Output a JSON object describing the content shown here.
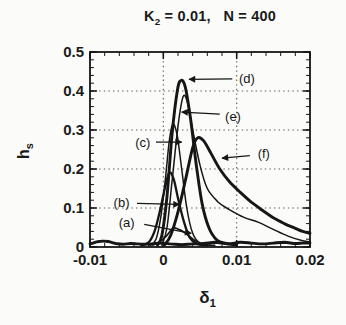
{
  "colors": {
    "ink": "#161616",
    "grid": "#5a5a5a",
    "background": "#fbfbf9"
  },
  "chart_data": {
    "type": "line",
    "title": "K2 = 0.01,  N = 400",
    "title_parts": {
      "base": "K",
      "sub": "2",
      "rest": " = 0.01,   N = 400"
    },
    "xlabel": "delta_1",
    "ylabel": "h_s",
    "xlabel_parts": {
      "base": "δ",
      "sub": "1"
    },
    "ylabel_parts": {
      "base": "h",
      "sub": "s"
    },
    "xlim": [
      -0.01,
      0.02
    ],
    "ylim": [
      0,
      0.5
    ],
    "grid": "dotted",
    "legend": "none",
    "x_ticks": [
      {
        "v": -0.01,
        "label": "-0.01"
      },
      {
        "v": 0,
        "label": "0"
      },
      {
        "v": 0.01,
        "label": "0.01"
      },
      {
        "v": 0.02,
        "label": "0.02"
      }
    ],
    "y_ticks": [
      {
        "v": 0,
        "label": "0"
      },
      {
        "v": 0.1,
        "label": "0.1"
      },
      {
        "v": 0.2,
        "label": "0.2"
      },
      {
        "v": 0.3,
        "label": "0.3"
      },
      {
        "v": 0.4,
        "label": "0.4"
      },
      {
        "v": 0.5,
        "label": "0.5"
      }
    ],
    "x_grid": [
      0,
      0.01
    ],
    "y_grid": [
      0.1,
      0.2,
      0.3,
      0.4
    ],
    "x_minor_step": 0.002,
    "y_minor_step": 0.02,
    "series": [
      {
        "name": "(a)",
        "width": 1.7,
        "points": [
          [
            -0.0015,
            0.005
          ],
          [
            -0.0005,
            0.013
          ],
          [
            0.0004,
            0.028
          ],
          [
            0.0013,
            0.048
          ],
          [
            0.002,
            0.046
          ],
          [
            0.003,
            0.036
          ],
          [
            0.0042,
            0.018
          ],
          [
            0.0055,
            0.007
          ],
          [
            0.007,
            0.004
          ]
        ]
      },
      {
        "name": "(b)",
        "width": 2.3,
        "points": [
          [
            -0.003,
            0.004
          ],
          [
            -0.002,
            0.012
          ],
          [
            -0.0012,
            0.04
          ],
          [
            -0.0005,
            0.09
          ],
          [
            0.0002,
            0.15
          ],
          [
            0.0008,
            0.19
          ],
          [
            0.0014,
            0.175
          ],
          [
            0.002,
            0.125
          ],
          [
            0.0028,
            0.065
          ],
          [
            0.0036,
            0.024
          ],
          [
            0.0046,
            0.008
          ],
          [
            0.006,
            0.004
          ]
        ]
      },
      {
        "name": "(c)",
        "width": 1.5,
        "points": [
          [
            -0.0018,
            0.004
          ],
          [
            -0.001,
            0.02
          ],
          [
            -0.0004,
            0.07
          ],
          [
            0.0002,
            0.16
          ],
          [
            0.0008,
            0.27
          ],
          [
            0.0013,
            0.315
          ],
          [
            0.0019,
            0.285
          ],
          [
            0.0025,
            0.2
          ],
          [
            0.0032,
            0.1
          ],
          [
            0.004,
            0.035
          ],
          [
            0.005,
            0.01
          ],
          [
            0.0065,
            0.004
          ]
        ]
      },
      {
        "name": "(d)",
        "width": 2.9,
        "points": [
          [
            -0.0008,
            0.005
          ],
          [
            -0.0002,
            0.03
          ],
          [
            0.0005,
            0.13
          ],
          [
            0.0012,
            0.29
          ],
          [
            0.0019,
            0.4
          ],
          [
            0.0024,
            0.427
          ],
          [
            0.003,
            0.41
          ],
          [
            0.0037,
            0.33
          ],
          [
            0.0045,
            0.21
          ],
          [
            0.0053,
            0.11
          ],
          [
            0.0062,
            0.05
          ],
          [
            0.0073,
            0.018
          ],
          [
            0.0086,
            0.009
          ],
          [
            0.01,
            0.005
          ]
        ]
      },
      {
        "name": "(e)",
        "width": 1.5,
        "points": [
          [
            -0.0002,
            0.004
          ],
          [
            0.0005,
            0.05
          ],
          [
            0.0012,
            0.17
          ],
          [
            0.002,
            0.31
          ],
          [
            0.0027,
            0.385
          ],
          [
            0.0033,
            0.37
          ],
          [
            0.004,
            0.3
          ],
          [
            0.005,
            0.21
          ],
          [
            0.006,
            0.15
          ],
          [
            0.0075,
            0.115
          ],
          [
            0.009,
            0.096
          ],
          [
            0.011,
            0.076
          ],
          [
            0.013,
            0.063
          ],
          [
            0.015,
            0.045
          ],
          [
            0.017,
            0.028
          ],
          [
            0.019,
            0.016
          ],
          [
            0.02,
            0.013
          ]
        ]
      },
      {
        "name": "(f)",
        "width": 2.9,
        "points": [
          [
            0.0002,
            0.006
          ],
          [
            0.001,
            0.03
          ],
          [
            0.002,
            0.09
          ],
          [
            0.003,
            0.17
          ],
          [
            0.004,
            0.255
          ],
          [
            0.0047,
            0.28
          ],
          [
            0.0055,
            0.272
          ],
          [
            0.0065,
            0.24
          ],
          [
            0.0077,
            0.2
          ],
          [
            0.009,
            0.168
          ],
          [
            0.0105,
            0.14
          ],
          [
            0.012,
            0.115
          ],
          [
            0.0135,
            0.094
          ],
          [
            0.015,
            0.075
          ],
          [
            0.0165,
            0.06
          ],
          [
            0.018,
            0.048
          ],
          [
            0.019,
            0.04
          ],
          [
            0.02,
            0.035
          ]
        ]
      },
      {
        "name": "baseline",
        "width": 2.9,
        "points": [
          [
            -0.01,
            0.008
          ],
          [
            -0.0093,
            0.012
          ],
          [
            -0.0085,
            0.015
          ],
          [
            -0.0075,
            0.014
          ],
          [
            -0.0065,
            0.009
          ],
          [
            -0.0055,
            0.007
          ],
          [
            -0.0045,
            0.009
          ],
          [
            -0.0035,
            0.008
          ],
          [
            -0.0025,
            0.007
          ],
          [
            -0.0015,
            0.008
          ],
          [
            -0.0005,
            0.01
          ],
          [
            0.001,
            0.008
          ],
          [
            0.0025,
            0.006
          ],
          [
            0.004,
            0.008
          ],
          [
            0.0055,
            0.009
          ],
          [
            0.007,
            0.012
          ],
          [
            0.008,
            0.01
          ],
          [
            0.009,
            0.008
          ],
          [
            0.0105,
            0.012
          ],
          [
            0.012,
            0.01
          ],
          [
            0.0135,
            0.008
          ],
          [
            0.015,
            0.01
          ],
          [
            0.0165,
            0.012
          ],
          [
            0.018,
            0.009
          ],
          [
            0.019,
            0.01
          ],
          [
            0.02,
            0.01
          ]
        ]
      }
    ],
    "annotations": [
      {
        "id": "d",
        "label": "(d)",
        "tx": 0.0114,
        "ty": 0.433,
        "ax1": 0.0094,
        "ay1": 0.431,
        "ax2": 0.0035,
        "ay2": 0.43
      },
      {
        "id": "e",
        "label": "(e)",
        "tx": 0.0095,
        "ty": 0.336,
        "ax1": 0.0077,
        "ay1": 0.341,
        "ax2": 0.0025,
        "ay2": 0.346
      },
      {
        "id": "c",
        "label": "(c)",
        "tx": -0.0028,
        "ty": 0.269,
        "ax1": -0.001,
        "ay1": 0.269,
        "ax2": 0.0025,
        "ay2": 0.269
      },
      {
        "id": "f",
        "label": "(f)",
        "tx": 0.0137,
        "ty": 0.241,
        "ax1": 0.0118,
        "ay1": 0.234,
        "ax2": 0.008,
        "ay2": 0.228
      },
      {
        "id": "b",
        "label": "(b)",
        "tx": -0.0057,
        "ty": 0.115,
        "ax1": -0.0036,
        "ay1": 0.112,
        "ax2": 0.0022,
        "ay2": 0.109
      },
      {
        "id": "a",
        "label": "(a)",
        "tx": -0.005,
        "ty": 0.064,
        "ax1": -0.0026,
        "ay1": 0.058,
        "ax2": 0.0038,
        "ay2": 0.035
      }
    ]
  }
}
